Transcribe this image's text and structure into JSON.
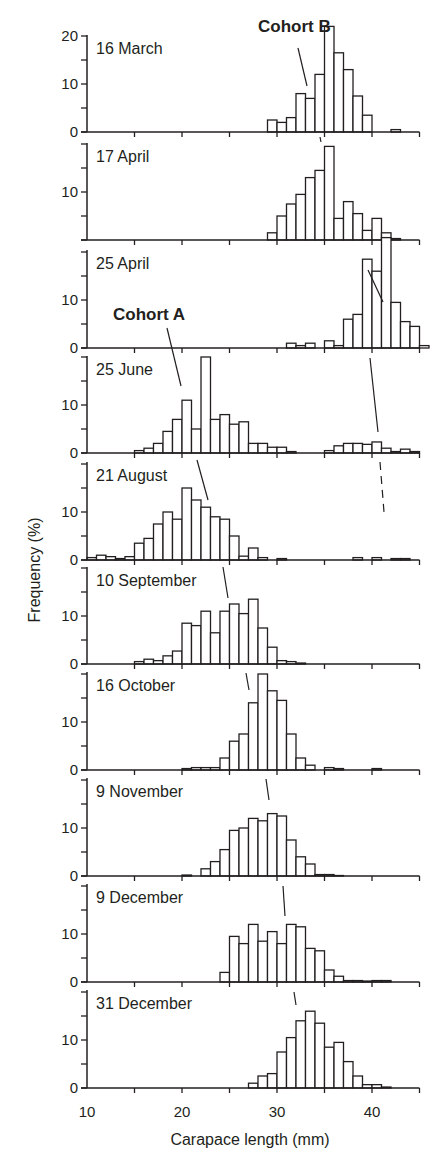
{
  "chart_data": {
    "type": "bar",
    "subtype": "stacked-histogram-panels",
    "xlabel": "Carapace length (mm)",
    "ylabel": "Frequency (%)",
    "xlim": [
      10,
      45
    ],
    "x_ticks": [
      10,
      20,
      30,
      40
    ],
    "x_minor_ticks": [
      15,
      25,
      35,
      45
    ],
    "bin_width_mm": 1,
    "annotations": [
      {
        "text": "Cohort B",
        "panel": "16 March",
        "bold": true
      },
      {
        "text": "Cohort A",
        "panel": "25 April",
        "bold": true
      }
    ],
    "panels": [
      {
        "label": "16 March",
        "ylim": [
          0,
          20
        ],
        "y_ticks": [
          0,
          10,
          20
        ],
        "bins": [
          [
            29,
            2.5
          ],
          [
            30,
            2
          ],
          [
            31,
            3
          ],
          [
            32,
            8
          ],
          [
            33,
            7
          ],
          [
            34,
            12
          ],
          [
            35,
            22
          ],
          [
            36,
            16.5
          ],
          [
            37,
            13
          ],
          [
            38,
            7.5
          ],
          [
            39,
            3.5
          ],
          [
            42,
            0.5
          ]
        ]
      },
      {
        "label": "17 April",
        "ylim": [
          0,
          20
        ],
        "y_ticks": [
          10
        ],
        "bins": [
          [
            29,
            1.5
          ],
          [
            30,
            5
          ],
          [
            31,
            7.5
          ],
          [
            32,
            9.5
          ],
          [
            33,
            13
          ],
          [
            34,
            14.5
          ],
          [
            35,
            19.5
          ],
          [
            36,
            4.5
          ],
          [
            37,
            8
          ],
          [
            38,
            5.5
          ],
          [
            39,
            2
          ],
          [
            40,
            4.5
          ],
          [
            41,
            1.5
          ],
          [
            42,
            0.3
          ]
        ]
      },
      {
        "label": "25 April",
        "ylim": [
          0,
          20
        ],
        "y_ticks": [
          0,
          10
        ],
        "bins": [
          [
            31,
            1
          ],
          [
            32,
            0.5
          ],
          [
            33,
            1
          ],
          [
            35,
            1.5
          ],
          [
            36,
            0.5
          ],
          [
            37,
            6
          ],
          [
            38,
            7
          ],
          [
            39,
            18.5
          ],
          [
            40,
            16
          ],
          [
            41,
            23
          ],
          [
            42,
            9.5
          ],
          [
            43,
            5.5
          ],
          [
            44,
            4.5
          ],
          [
            45,
            0.5
          ]
        ]
      },
      {
        "label": "25 June",
        "ylim": [
          0,
          20
        ],
        "y_ticks": [
          0,
          10
        ],
        "bins": [
          [
            15,
            0.5
          ],
          [
            16,
            1
          ],
          [
            17,
            2
          ],
          [
            18,
            4.5
          ],
          [
            19,
            7
          ],
          [
            20,
            11
          ],
          [
            21,
            5
          ],
          [
            22,
            20
          ],
          [
            23,
            7
          ],
          [
            24,
            8
          ],
          [
            25,
            6
          ],
          [
            26,
            6.5
          ],
          [
            27,
            2
          ],
          [
            28,
            2
          ],
          [
            29,
            1.2
          ],
          [
            30,
            1.2
          ],
          [
            31,
            0.3
          ],
          [
            35,
            0.5
          ],
          [
            36,
            1.5
          ],
          [
            37,
            2
          ],
          [
            38,
            2
          ],
          [
            39,
            1.8
          ],
          [
            40,
            2.3
          ],
          [
            41,
            1
          ],
          [
            42,
            0.3
          ],
          [
            43,
            0.8
          ],
          [
            44,
            0.3
          ]
        ]
      },
      {
        "label": "21 August",
        "ylim": [
          0,
          20
        ],
        "y_ticks": [
          0,
          10
        ],
        "bins": [
          [
            10,
            0.5
          ],
          [
            11,
            1
          ],
          [
            12,
            0.7
          ],
          [
            13,
            0.3
          ],
          [
            14,
            0.7
          ],
          [
            15,
            3.5
          ],
          [
            16,
            4.5
          ],
          [
            17,
            7.5
          ],
          [
            18,
            10
          ],
          [
            19,
            8.5
          ],
          [
            20,
            15
          ],
          [
            21,
            12.5
          ],
          [
            22,
            11
          ],
          [
            23,
            9
          ],
          [
            24,
            8.5
          ],
          [
            25,
            5
          ],
          [
            26,
            0.8
          ],
          [
            27,
            2.5
          ],
          [
            28,
            0.5
          ],
          [
            30,
            0.3
          ],
          [
            38,
            0.5
          ],
          [
            40,
            0.5
          ],
          [
            42,
            0.3
          ],
          [
            43,
            0.3
          ]
        ]
      },
      {
        "label": "10 September",
        "ylim": [
          0,
          20
        ],
        "y_ticks": [
          0,
          10
        ],
        "bins": [
          [
            15,
            0.5
          ],
          [
            16,
            1
          ],
          [
            17,
            0.7
          ],
          [
            18,
            1.7
          ],
          [
            19,
            2.7
          ],
          [
            20,
            8.5
          ],
          [
            21,
            8
          ],
          [
            22,
            11
          ],
          [
            23,
            6.5
          ],
          [
            24,
            11
          ],
          [
            25,
            12.5
          ],
          [
            26,
            10.5
          ],
          [
            27,
            13.5
          ],
          [
            28,
            7.5
          ],
          [
            29,
            3.5
          ],
          [
            30,
            0.7
          ],
          [
            31,
            0.5
          ],
          [
            32,
            0.2
          ]
        ]
      },
      {
        "label": "16 October",
        "ylim": [
          0,
          20
        ],
        "y_ticks": [
          0,
          10
        ],
        "bins": [
          [
            20,
            0.3
          ],
          [
            21,
            0.5
          ],
          [
            22,
            0.5
          ],
          [
            23,
            0.5
          ],
          [
            24,
            2.5
          ],
          [
            25,
            6
          ],
          [
            26,
            7.5
          ],
          [
            27,
            14
          ],
          [
            28,
            20
          ],
          [
            29,
            16.5
          ],
          [
            30,
            14.5
          ],
          [
            31,
            7.5
          ],
          [
            32,
            2.5
          ],
          [
            33,
            1
          ],
          [
            35,
            0.5
          ],
          [
            36,
            0.3
          ],
          [
            40,
            0.3
          ]
        ]
      },
      {
        "label": "9 November",
        "ylim": [
          0,
          20
        ],
        "y_ticks": [
          0,
          10
        ],
        "bins": [
          [
            20,
            0.2
          ],
          [
            22,
            1.5
          ],
          [
            23,
            3
          ],
          [
            24,
            5.5
          ],
          [
            25,
            9.5
          ],
          [
            26,
            10
          ],
          [
            27,
            12
          ],
          [
            28,
            11.5
          ],
          [
            29,
            13
          ],
          [
            30,
            12.5
          ],
          [
            31,
            7.5
          ],
          [
            32,
            4
          ],
          [
            33,
            2.5
          ],
          [
            34,
            0.3
          ],
          [
            35,
            0.3
          ],
          [
            36,
            0.1
          ]
        ]
      },
      {
        "label": "9 December",
        "ylim": [
          0,
          20
        ],
        "y_ticks": [
          0,
          10
        ],
        "bins": [
          [
            24,
            2
          ],
          [
            25,
            9.5
          ],
          [
            26,
            8
          ],
          [
            27,
            12
          ],
          [
            28,
            8.5
          ],
          [
            29,
            10.5
          ],
          [
            30,
            8
          ],
          [
            31,
            12
          ],
          [
            32,
            11.5
          ],
          [
            33,
            7
          ],
          [
            34,
            6.5
          ],
          [
            35,
            2.5
          ],
          [
            36,
            1.2
          ],
          [
            37,
            0.3
          ],
          [
            38,
            0.3
          ],
          [
            39,
            0.2
          ],
          [
            40,
            0.3
          ],
          [
            41,
            0.3
          ]
        ]
      },
      {
        "label": "31 December",
        "ylim": [
          0,
          20
        ],
        "y_ticks": [
          0,
          10
        ],
        "bins": [
          [
            27,
            1
          ],
          [
            28,
            2.5
          ],
          [
            29,
            3
          ],
          [
            30,
            7.5
          ],
          [
            31,
            10.5
          ],
          [
            32,
            14
          ],
          [
            33,
            16
          ],
          [
            34,
            13.5
          ],
          [
            35,
            8.5
          ],
          [
            36,
            9.5
          ],
          [
            37,
            5.5
          ],
          [
            38,
            2.5
          ],
          [
            39,
            0.7
          ],
          [
            40,
            0.7
          ],
          [
            41,
            0.2
          ]
        ]
      }
    ],
    "cohort_tracking_lines": {
      "cohort_A": [
        [
          20.3,
          "25 April label"
        ],
        [
          20.5,
          "25 June"
        ],
        [
          22.6,
          "21 August"
        ],
        [
          24.2,
          "10 September"
        ],
        [
          27.2,
          "16 October"
        ],
        [
          29.5,
          "9 November"
        ],
        [
          31.2,
          "9 December"
        ],
        [
          32.8,
          "31 December"
        ]
      ],
      "cohort_B": [
        [
          33.8,
          "16 March"
        ],
        [
          34.7,
          "17 April"
        ],
        [
          38.5,
          "25 April"
        ],
        [
          40.8,
          "25 June"
        ],
        [
          41.2,
          "21 August (dashed)"
        ]
      ]
    },
    "legend": null,
    "grid": false
  },
  "colors": {
    "ink": "#231f20",
    "bar_fill": "#ffffff",
    "background": "#ffffff"
  }
}
